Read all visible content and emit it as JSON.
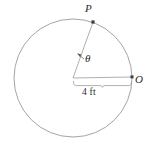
{
  "figure": {
    "type": "geometry-diagram",
    "labels": {
      "point_p": "P",
      "point_o": "O",
      "angle": "θ",
      "radius_length": "4 ft"
    },
    "colors": {
      "stroke": "#8c8c8c",
      "text": "#2b2b2b",
      "point_marker": "#4a4a4a",
      "background": "#ffffff"
    },
    "geometry": {
      "center_x": 73,
      "center_y": 78,
      "radius_px": 59,
      "point_p_x": 93,
      "point_p_y": 22,
      "point_o_x": 132,
      "point_o_y": 77,
      "brace_left_x": 73,
      "brace_right_x": 132,
      "brace_y": 83
    }
  }
}
